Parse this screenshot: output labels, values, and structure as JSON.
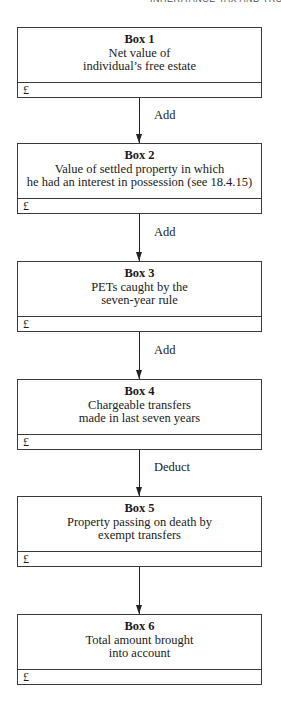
{
  "header": {
    "running_head": "INHERITANCE TAX AND TRUSTS"
  },
  "boxes": [
    {
      "title": "Box 1",
      "lines": [
        "Net value of",
        "individual’s free estate"
      ],
      "footer": "£"
    },
    {
      "title": "Box 2",
      "lines": [
        "Value of settled property in which",
        "he had an interest in possession (see 18.4.15)"
      ],
      "footer": "£"
    },
    {
      "title": "Box 3",
      "lines": [
        "PETs caught by the",
        "seven-year rule"
      ],
      "footer": "£"
    },
    {
      "title": "Box 4",
      "lines": [
        "Chargeable transfers",
        "made in last seven years"
      ],
      "footer": "£"
    },
    {
      "title": "Box 5",
      "lines": [
        "Property passing on death by",
        "exempt transfers"
      ],
      "footer": "£"
    },
    {
      "title": "Box 6",
      "lines": [
        "Total amount brought",
        "into account"
      ],
      "footer": "£"
    }
  ],
  "arrows": [
    {
      "label": "Add"
    },
    {
      "label": "Add"
    },
    {
      "label": "Add"
    },
    {
      "label": "Deduct"
    },
    {
      "label": ""
    }
  ]
}
